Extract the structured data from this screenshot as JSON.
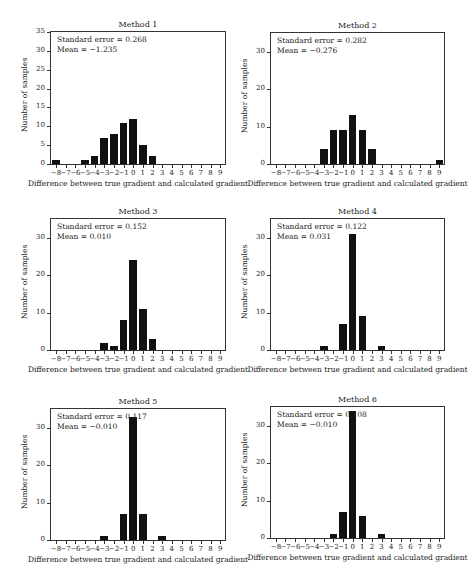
{
  "chart_data": [
    {
      "type": "bar",
      "title": "Method 1",
      "annotations": [
        "Standard error = 0.268",
        "Mean = −1.235"
      ],
      "xlabel": "Difference between true gradient and calculated gradient",
      "ylabel": "Number of samples",
      "categories": [
        -8,
        -7,
        -6,
        -5,
        -4,
        -3,
        -2,
        -1,
        0,
        1,
        2,
        3,
        4,
        5,
        6,
        7,
        8,
        9
      ],
      "values": [
        1,
        0,
        0,
        1,
        2,
        7,
        8,
        11,
        12,
        5,
        2,
        0,
        0,
        0,
        0,
        0,
        0,
        0
      ],
      "ylim": [
        0,
        35
      ],
      "yticks": [
        0,
        5,
        10,
        15,
        20,
        25,
        30,
        35
      ]
    },
    {
      "type": "bar",
      "title": "Method 2",
      "annotations": [
        "Standard error = 0.282",
        "Mean = −0.276"
      ],
      "xlabel": "Difference between true gradient and calculated gradient",
      "ylabel": "Number of samples",
      "categories": [
        -8,
        -7,
        -6,
        -5,
        -4,
        -3,
        -2,
        -1,
        0,
        1,
        2,
        3,
        4,
        5,
        6,
        7,
        8,
        9
      ],
      "values": [
        0,
        0,
        0,
        0,
        0,
        4,
        9,
        9,
        13,
        9,
        4,
        0,
        0,
        0,
        0,
        0,
        0,
        1
      ],
      "ylim": [
        0,
        35
      ],
      "yticks": [
        0,
        10,
        20,
        30
      ]
    },
    {
      "type": "bar",
      "title": "Method 3",
      "annotations": [
        "Standard error = 0.152",
        "Mean = 0.010"
      ],
      "xlabel": "Difference between true gradient and calculated gradient",
      "ylabel": "Number of samples",
      "categories": [
        -8,
        -7,
        -6,
        -5,
        -4,
        -3,
        -2,
        -1,
        0,
        1,
        2,
        3,
        4,
        5,
        6,
        7,
        8,
        9
      ],
      "values": [
        0,
        0,
        0,
        0,
        0,
        2,
        1,
        8,
        24,
        11,
        3,
        0,
        0,
        0,
        0,
        0,
        0,
        0
      ],
      "ylim": [
        0,
        35
      ],
      "yticks": [
        0,
        10,
        20,
        30
      ]
    },
    {
      "type": "bar",
      "title": "Method 4",
      "annotations": [
        "Standard error = 0.122",
        "Mean = 0.031"
      ],
      "xlabel": "Difference between true gradient and calculated gradient",
      "ylabel": "Number of samples",
      "categories": [
        -8,
        -7,
        -6,
        -5,
        -4,
        -3,
        -2,
        -1,
        0,
        1,
        2,
        3,
        4,
        5,
        6,
        7,
        8,
        9
      ],
      "values": [
        0,
        0,
        0,
        0,
        0,
        1,
        0,
        7,
        31,
        9,
        0,
        1,
        0,
        0,
        0,
        0,
        0,
        0
      ],
      "ylim": [
        0,
        35
      ],
      "yticks": [
        0,
        10,
        20,
        30
      ]
    },
    {
      "type": "bar",
      "title": "Method 5",
      "annotations": [
        "Standard error = 0.117",
        "Mean = −0.010"
      ],
      "xlabel": "Difference between true gradient and calculated gradient",
      "ylabel": "Number of samples",
      "categories": [
        -8,
        -7,
        -6,
        -5,
        -4,
        -3,
        -2,
        -1,
        0,
        1,
        2,
        3,
        4,
        5,
        6,
        7,
        8,
        9
      ],
      "values": [
        0,
        0,
        0,
        0,
        0,
        1,
        0,
        7,
        33,
        7,
        0,
        1,
        0,
        0,
        0,
        0,
        0,
        0
      ],
      "ylim": [
        0,
        35
      ],
      "yticks": [
        0,
        10,
        20,
        30
      ]
    },
    {
      "type": "bar",
      "title": "Method 6",
      "annotations": [
        "Standard error = 0.108",
        "Mean = −0.010"
      ],
      "xlabel": "Difference between true gradient and calculated gradient",
      "ylabel": "Number of samples",
      "categories": [
        -8,
        -7,
        -6,
        -5,
        -4,
        -3,
        -2,
        -1,
        0,
        1,
        2,
        3,
        4,
        5,
        6,
        7,
        8,
        9
      ],
      "values": [
        0,
        0,
        0,
        0,
        0,
        0,
        1,
        7,
        34,
        6,
        0,
        1,
        0,
        0,
        0,
        0,
        0,
        0
      ],
      "ylim": [
        0,
        35
      ],
      "yticks": [
        0,
        10,
        20,
        30
      ]
    }
  ],
  "tick_labels": [
    "−8",
    "−7",
    "−6",
    "−5",
    "−4",
    "−3",
    "−2",
    "−1",
    "0",
    "1",
    "2",
    "3",
    "4",
    "5",
    "6",
    "7",
    "8",
    "9"
  ]
}
